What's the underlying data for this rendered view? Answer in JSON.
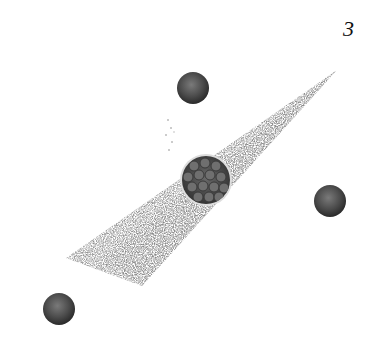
{
  "figure": {
    "label": "3"
  },
  "elements": {
    "wedge": {
      "tip": [
        337,
        70
      ],
      "base": [
        [
          66,
          258
        ],
        [
          142,
          286
        ]
      ],
      "color": "#8a8a8a"
    },
    "inset": {
      "cx": 206,
      "cy": 180,
      "r": 25,
      "color": "#4a4a4a"
    },
    "spheres": [
      {
        "cx": 193,
        "cy": 88,
        "r": 16
      },
      {
        "cx": 330,
        "cy": 201,
        "r": 16
      },
      {
        "cx": 59,
        "cy": 309,
        "r": 16
      }
    ]
  }
}
